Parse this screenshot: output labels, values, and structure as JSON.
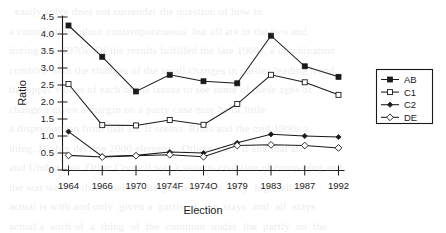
{
  "chart_data": {
    "type": "line",
    "title": "",
    "xlabel": "Election",
    "ylabel": "Ratio",
    "categories": [
      "1964",
      "1966",
      "1970",
      "1974F",
      "1974O",
      "1979",
      "1983",
      "1987",
      "1992"
    ],
    "ylim": [
      0,
      4.5
    ],
    "ytick_labels": [
      "0",
      "0.5",
      "1.0",
      "1.5",
      "2.0",
      "2.5",
      "3.0",
      "3.5",
      "4.0",
      "4.5"
    ],
    "ytick_values": [
      0,
      0.5,
      1.0,
      1.5,
      2.0,
      2.5,
      3.0,
      3.5,
      4.0,
      4.5
    ],
    "grid": false,
    "legend_position": "right",
    "series": [
      {
        "name": "AB",
        "marker": "filled-square",
        "values": [
          4.25,
          3.33,
          2.31,
          2.8,
          2.61,
          2.55,
          3.95,
          3.05,
          2.74
        ]
      },
      {
        "name": "C1",
        "marker": "open-square",
        "values": [
          2.53,
          1.32,
          1.31,
          1.47,
          1.33,
          1.94,
          2.8,
          2.58,
          2.21
        ]
      },
      {
        "name": "C2",
        "marker": "filled-diamond",
        "values": [
          1.13,
          0.4,
          0.43,
          0.53,
          0.5,
          0.8,
          1.05,
          1.0,
          0.97
        ]
      },
      {
        "name": "DE",
        "marker": "open-diamond",
        "values": [
          0.43,
          0.38,
          0.42,
          0.45,
          0.39,
          0.72,
          0.74,
          0.72,
          0.65
        ]
      }
    ]
  },
  "colors": {
    "ink": "#1a1a1a",
    "background": "#ffffff"
  }
}
